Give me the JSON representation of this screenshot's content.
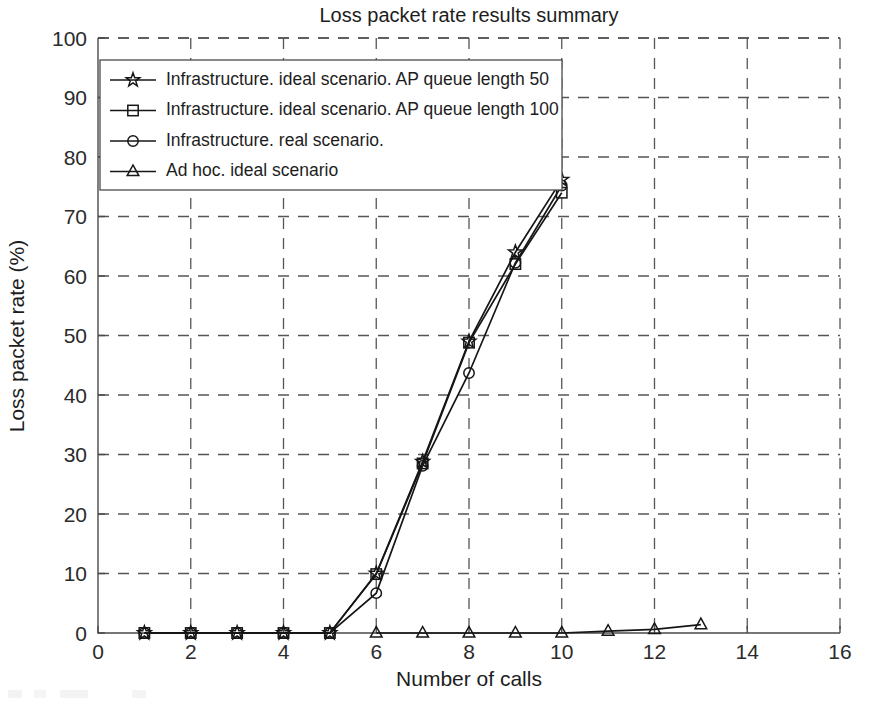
{
  "chart_data": {
    "type": "line",
    "title": "Loss packet rate results summary",
    "xlabel": "Number of calls",
    "ylabel": "Loss packet rate (%)",
    "xlim": [
      0,
      16
    ],
    "ylim": [
      0,
      100
    ],
    "xticks": [
      0,
      2,
      4,
      6,
      8,
      10,
      12,
      14,
      16
    ],
    "yticks": [
      0,
      10,
      20,
      30,
      40,
      50,
      60,
      70,
      80,
      90,
      100
    ],
    "grid": true,
    "legend_position": "upper-left-inside",
    "series": [
      {
        "name": "Infrastructure. ideal scenario. AP queue length 50",
        "marker": "pentagram",
        "x": [
          1,
          2,
          3,
          4,
          5,
          6,
          7,
          8,
          9,
          10
        ],
        "values": [
          0,
          0,
          0,
          0,
          0,
          10.0,
          28.8,
          49.0,
          64.0,
          76.2
        ]
      },
      {
        "name": "Infrastructure. ideal scenario. AP queue length 100",
        "marker": "square",
        "x": [
          1,
          2,
          3,
          4,
          5,
          6,
          7,
          8,
          9,
          10
        ],
        "values": [
          0,
          0,
          0,
          0,
          0,
          9.9,
          28.5,
          48.8,
          62.0,
          74.0
        ]
      },
      {
        "name": "Infrastructure. real scenario.",
        "marker": "circle",
        "x": [
          1,
          2,
          3,
          4,
          5,
          6,
          7,
          8,
          9,
          10
        ],
        "values": [
          0,
          0,
          0,
          0,
          0,
          6.7,
          28.1,
          43.7,
          62.2,
          75.2
        ]
      },
      {
        "name": "Ad hoc. ideal scenario",
        "marker": "triangle",
        "x": [
          6,
          7,
          8,
          9,
          10,
          11,
          12,
          13
        ],
        "values": [
          0,
          0,
          0,
          0,
          0,
          0.3,
          0.6,
          1.4
        ]
      }
    ]
  },
  "legend": {
    "entries": [
      {
        "label": "Infrastructure. ideal scenario. AP queue length 50"
      },
      {
        "label": "Infrastructure. ideal scenario. AP queue length 100"
      },
      {
        "label": "Infrastructure. real scenario."
      },
      {
        "label": "Ad hoc. ideal scenario"
      }
    ]
  },
  "icons": {
    "pentagram": "star-marker-icon",
    "square": "square-marker-icon",
    "circle": "circle-marker-icon",
    "triangle": "triangle-marker-icon"
  },
  "colors": {
    "line": "#161616",
    "axis": "#4a4a4a",
    "grid": "#55555a",
    "background": "#ffffff",
    "text": "#1d1d1d"
  }
}
